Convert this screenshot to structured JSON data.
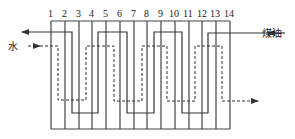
{
  "diagram": {
    "type": "multi-pass heat exchanger flow schematic",
    "plate_numbers": [
      "1",
      "2",
      "3",
      "4",
      "5",
      "6",
      "7",
      "8",
      "9",
      "10",
      "11",
      "12",
      "13",
      "14"
    ],
    "labels": {
      "water": "水",
      "kerosene": "煤油"
    },
    "colors": {
      "line": "#333333",
      "background": "#ffffff"
    },
    "flows": [
      {
        "name": "kerosene",
        "style": "solid",
        "direction": "right-to-left",
        "enters": "right",
        "exits": "left (labeled 水 side, top)"
      },
      {
        "name": "water",
        "style": "dashed",
        "direction": "left-to-right",
        "enters": "left",
        "exits": "right (bottom)"
      }
    ]
  }
}
